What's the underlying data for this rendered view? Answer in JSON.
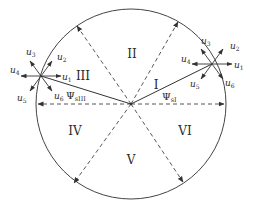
{
  "diagram": {
    "type": "voltage-vector-sector-diagram",
    "colors": {
      "stroke": "#333333",
      "text": "#2a2a2a",
      "background": "#ffffff"
    },
    "sectors": [
      {
        "id": "I",
        "label": "I"
      },
      {
        "id": "II",
        "label": "II"
      },
      {
        "id": "III",
        "label": "III"
      },
      {
        "id": "IV",
        "label": "IV"
      },
      {
        "id": "V",
        "label": "V"
      },
      {
        "id": "VI",
        "label": "VI"
      }
    ],
    "left_star": {
      "vectors": [
        {
          "base": "u",
          "sub": "1"
        },
        {
          "base": "u",
          "sub": "2"
        },
        {
          "base": "u",
          "sub": "3"
        },
        {
          "base": "u",
          "sub": "4"
        },
        {
          "base": "u",
          "sub": "5"
        },
        {
          "base": "u",
          "sub": "6"
        }
      ],
      "flux_label": {
        "base": "Ψ",
        "sub": "sIII"
      }
    },
    "right_star": {
      "vectors": [
        {
          "base": "u",
          "sub": "1"
        },
        {
          "base": "u",
          "sub": "2"
        },
        {
          "base": "u",
          "sub": "3"
        },
        {
          "base": "u",
          "sub": "4"
        },
        {
          "base": "u",
          "sub": "5"
        },
        {
          "base": "u",
          "sub": "6"
        }
      ],
      "flux_label": {
        "base": "Ψ",
        "sub": "sI"
      }
    }
  }
}
